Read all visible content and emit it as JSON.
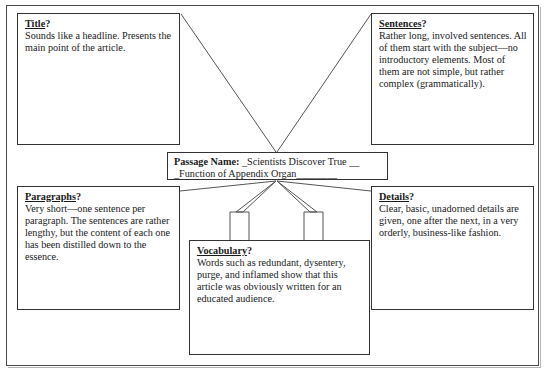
{
  "document": {
    "type": "graphic-organizer-worksheet",
    "boxes": {
      "title": {
        "heading": "Title",
        "question_mark": "?",
        "body": "Sounds like a headline.  Presents the main point of the article."
      },
      "sentences": {
        "heading": "Sentences",
        "question_mark": "?",
        "body": "Rather long, involved sentences.  All of them start with the subject—no introductory elements.  Most of them are not simple, but rather complex (grammatically)."
      },
      "paragraphs": {
        "heading": "Paragraphs",
        "question_mark": "?",
        "body": "Very short—one sentence per paragraph.  The sentences are rather lengthy, but the content of each one has been distilled down to the essence."
      },
      "details": {
        "heading": "Details",
        "question_mark": "?",
        "body": "Clear, basic, unadorned details are given, one after the next, in a very orderly, business-like fashion."
      },
      "vocabulary": {
        "heading": "Vocabulary",
        "question_mark": "?",
        "body": "Words such as redundant, dysentery, purge, and inflamed show that this article was obviously written for an educated audience."
      },
      "passage": {
        "label": "Passage Name:",
        "value_line1": "_Scientists Discover True __",
        "value_line2": "_Function of Appendix Organ________"
      }
    },
    "colors": {
      "border": "#333333",
      "page_border": "#4a4a4a",
      "connector": "#555555",
      "text": "#1a1a1a",
      "background": "#ffffff"
    }
  }
}
